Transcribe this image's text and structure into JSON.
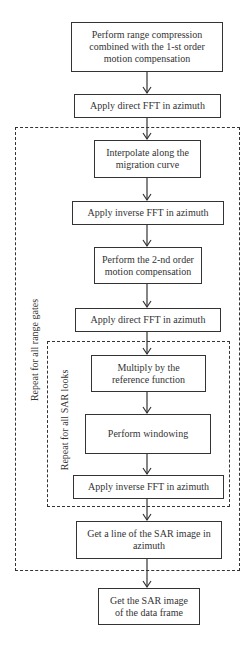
{
  "diagram": {
    "type": "flowchart",
    "steps": [
      {
        "id": "s1",
        "label": "Perform range compression combined with the 1-st order motion compensation"
      },
      {
        "id": "s2",
        "label": "Apply direct FFT in azimuth"
      },
      {
        "id": "s3",
        "label": "Interpolate along the migration curve"
      },
      {
        "id": "s4",
        "label": "Apply inverse FFT in azimuth"
      },
      {
        "id": "s5",
        "label": "Perform the 2-nd order motion compensation"
      },
      {
        "id": "s6",
        "label": "Apply direct FFT in azimuth"
      },
      {
        "id": "s7",
        "label": "Multiply by the reference function"
      },
      {
        "id": "s8",
        "label": "Perform windowing"
      },
      {
        "id": "s9",
        "label": "Apply inverse FFT in azimuth"
      },
      {
        "id": "s10",
        "label": "Get a line of the SAR image in azimuth"
      },
      {
        "id": "s11",
        "label": "Get the SAR image of the data frame"
      }
    ],
    "loops": [
      {
        "id": "outer",
        "label": "Repeat for all range gates",
        "contains": [
          "s3",
          "s4",
          "s5",
          "s6",
          "s7",
          "s8",
          "s9",
          "s10"
        ]
      },
      {
        "id": "inner",
        "label": "Repeat for all SAR looks",
        "contains": [
          "s7",
          "s8",
          "s9"
        ]
      }
    ],
    "colors": {
      "stroke": "#333333",
      "background": "#ffffff"
    }
  }
}
